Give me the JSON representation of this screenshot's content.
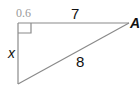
{
  "diagram": {
    "type": "right-triangle",
    "labels": {
      "top_left_value": "0.6",
      "top_side": "7",
      "hypotenuse": "8",
      "left_side": "x",
      "vertex_right": "A"
    },
    "colors": {
      "stroke": "#8a8a8a",
      "text": "#111111",
      "muted_text": "#9a9a9a",
      "background": "#ffffff"
    },
    "vertices": {
      "right_angle": [
        18,
        23
      ],
      "A": [
        129,
        23
      ],
      "bottom": [
        18,
        84
      ]
    }
  }
}
